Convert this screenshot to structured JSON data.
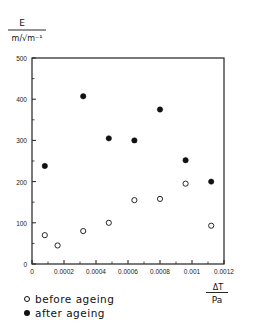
{
  "chart_data": {
    "type": "scatter",
    "title": "",
    "ylabel_num": "E",
    "ylabel_den": "m/√m⁻¹",
    "xlabel_num": "ΔT",
    "xlabel_den": "Pa",
    "xlim": [
      0,
      0.0012
    ],
    "ylim": [
      0,
      500
    ],
    "xticks": [
      "0",
      "0.0002",
      "0.0004",
      "0.0006",
      "0.0008",
      "0.001",
      "0.0012"
    ],
    "yticks": [
      "0",
      "100",
      "200",
      "300",
      "400",
      "500"
    ],
    "grid": false,
    "legend_position": "below",
    "series": [
      {
        "name": "before ageing",
        "marker": "open-circle",
        "x": [
          8e-05,
          0.00016,
          0.00032,
          0.00048,
          0.00064,
          0.0008,
          0.00096,
          0.00112
        ],
        "y": [
          70,
          45,
          80,
          100,
          155,
          158,
          195,
          93
        ]
      },
      {
        "name": "after ageing",
        "marker": "filled-circle",
        "x": [
          8e-05,
          0.00032,
          0.00048,
          0.00064,
          0.0008,
          0.00096,
          0.00112
        ],
        "y": [
          238,
          407,
          305,
          300,
          375,
          252,
          200
        ]
      }
    ]
  },
  "legend": {
    "before": "before ageing",
    "after": "after ageing"
  }
}
